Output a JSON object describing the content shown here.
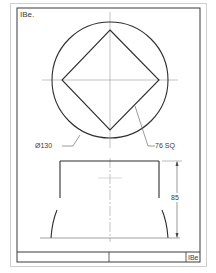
{
  "sheet": {
    "label_top_left": "IBe.",
    "title_block_code": "IBe"
  },
  "top_view": {
    "circle_dimension": "Ø130",
    "square_dimension": "76 SQ"
  },
  "front_view": {
    "height_dimension": "85"
  },
  "colors": {
    "line": "#2e2e2e",
    "thin_line": "#8a8a8a",
    "border_outer": "#c8c8c8",
    "paper": "#ffffff"
  }
}
